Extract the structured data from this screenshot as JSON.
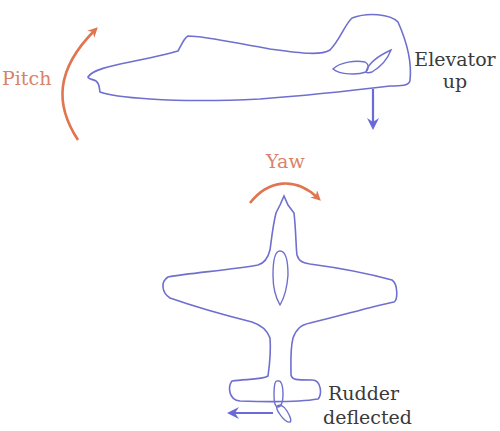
{
  "colors": {
    "outline": "#6f6fd0",
    "motion_arrow": "#e0754f",
    "control_arrow": "#6a6ad8",
    "text": "#3a3a3a",
    "accent_text": "#d9826a"
  },
  "side_view": {
    "rotation_label": "Pitch",
    "control_label_line1": "Elevator",
    "control_label_line2": "up"
  },
  "top_view": {
    "rotation_label": "Yaw",
    "control_label_line1": "Rudder",
    "control_label_line2": "deflected"
  }
}
